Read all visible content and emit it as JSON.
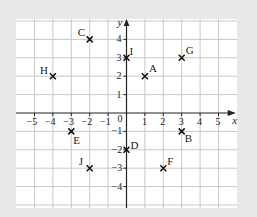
{
  "chart_data": {
    "type": "scatter",
    "title": "",
    "xlabel": "x",
    "ylabel": "y",
    "xlim": [
      -6,
      6
    ],
    "ylim": [
      -5,
      5
    ],
    "grid": true,
    "x_ticks": [
      "-5",
      "-4",
      "-3",
      "-2",
      "-1",
      "1",
      "2",
      "3",
      "4",
      "5"
    ],
    "y_ticks": [
      "4",
      "3",
      "2",
      "1",
      "-1",
      "-2",
      "-3",
      "-4"
    ],
    "origin_label": "0",
    "points": [
      {
        "label": "A",
        "x": 1,
        "y": 2
      },
      {
        "label": "B",
        "x": 3,
        "y": -1
      },
      {
        "label": "C",
        "x": -2,
        "y": 4
      },
      {
        "label": "D",
        "x": 0,
        "y": -2
      },
      {
        "label": "E",
        "x": -3,
        "y": -1
      },
      {
        "label": "F",
        "x": 2,
        "y": -3
      },
      {
        "label": "G",
        "x": 3,
        "y": 3
      },
      {
        "label": "H",
        "x": -4,
        "y": 2
      },
      {
        "label": "I",
        "x": 0,
        "y": 3
      },
      {
        "label": "J",
        "x": -2,
        "y": -3
      }
    ]
  },
  "colors": {
    "background": "#e8e8e8",
    "grid_bg": "#ffffff",
    "grid_line": "#c8c8c8",
    "axis": "#222222"
  }
}
